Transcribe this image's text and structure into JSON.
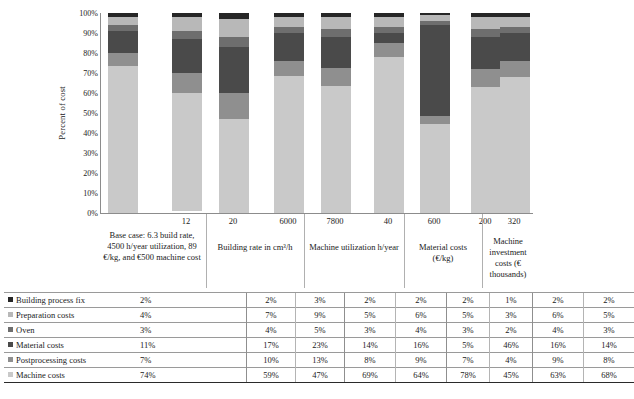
{
  "chart_data": {
    "type": "bar",
    "subtype": "stacked-bar-100-percent",
    "title": "",
    "xlabel": "",
    "ylabel": "Percent of cost",
    "ylim": [
      0,
      100
    ],
    "yticks": [
      "0%",
      "10%",
      "20%",
      "30%",
      "40%",
      "50%",
      "60%",
      "70%",
      "80%",
      "90%",
      "100%"
    ],
    "grid": false,
    "legend_position": "table-left-column",
    "stack_order_bottom_to_top": [
      "Machine costs",
      "Postprocessing costs",
      "Material costs",
      "Oven",
      "Preparation costs",
      "Building process fix"
    ],
    "categories": [
      "",
      "12",
      "20",
      "6000",
      "7800",
      "40",
      "600",
      "200",
      "320"
    ],
    "groups": [
      {
        "label": "Base case: 6.3 build rate, 4500 h/year utilization, 89 €/kg, and €500 machine cost",
        "members": [
          ""
        ]
      },
      {
        "label": "Building rate in cm³/h",
        "members": [
          "12",
          "20"
        ]
      },
      {
        "label": "Machine utilization h/year",
        "members": [
          "6000",
          "7800"
        ]
      },
      {
        "label": "Material costs (€/kg)",
        "members": [
          "40",
          "600"
        ]
      },
      {
        "label": "Machine investment costs (€ thousands)",
        "members": [
          "200",
          "320"
        ]
      }
    ],
    "series": [
      {
        "name": "Building process fix",
        "color": "#262626",
        "values": [
          2,
          2,
          3,
          2,
          2,
          2,
          1,
          2,
          2
        ]
      },
      {
        "name": "Preparation costs",
        "color": "#b8b8b8",
        "values": [
          4,
          7,
          9,
          5,
          6,
          5,
          3,
          6,
          5
        ]
      },
      {
        "name": "Oven",
        "color": "#6e6e6e",
        "values": [
          3,
          4,
          5,
          3,
          4,
          3,
          2,
          4,
          3
        ]
      },
      {
        "name": "Material costs",
        "color": "#4a4a4a",
        "values": [
          11,
          17,
          23,
          14,
          16,
          5,
          46,
          16,
          14
        ]
      },
      {
        "name": "Postprocessing costs",
        "color": "#8f8f8f",
        "values": [
          7,
          10,
          13,
          8,
          9,
          7,
          4,
          9,
          8
        ]
      },
      {
        "name": "Machine costs",
        "color": "#c9c9c9",
        "values": [
          74,
          59,
          47,
          69,
          64,
          78,
          45,
          63,
          68
        ]
      }
    ]
  },
  "table": {
    "row_labels": [
      "Building process fix",
      "Preparation costs",
      "Oven",
      "Material costs",
      "Postprocessing costs",
      "Machine costs"
    ],
    "rows": [
      {
        "label": "Building process fix",
        "swatch": "#262626",
        "cells": [
          "2%",
          "",
          "2%",
          "3%",
          "2%",
          "2%",
          "2%",
          "1%",
          "2%",
          "2%"
        ]
      },
      {
        "label": "Preparation costs",
        "swatch": "#b8b8b8",
        "cells": [
          "4%",
          "",
          "7%",
          "9%",
          "5%",
          "6%",
          "5%",
          "3%",
          "6%",
          "5%"
        ]
      },
      {
        "label": "Oven",
        "swatch": "#6e6e6e",
        "cells": [
          "3%",
          "",
          "4%",
          "5%",
          "3%",
          "4%",
          "3%",
          "2%",
          "4%",
          "3%"
        ]
      },
      {
        "label": "Material costs",
        "swatch": "#4a4a4a",
        "cells": [
          "11%",
          "",
          "17%",
          "23%",
          "14%",
          "16%",
          "5%",
          "46%",
          "16%",
          "14%"
        ]
      },
      {
        "label": "Postprocessing costs",
        "swatch": "#8f8f8f",
        "cells": [
          "7%",
          "",
          "10%",
          "13%",
          "8%",
          "9%",
          "7%",
          "4%",
          "9%",
          "8%"
        ]
      },
      {
        "label": "Machine costs",
        "swatch": "#c9c9c9",
        "cells": [
          "74%",
          "",
          "59%",
          "47%",
          "69%",
          "64%",
          "78%",
          "45%",
          "63%",
          "68%"
        ]
      }
    ]
  }
}
